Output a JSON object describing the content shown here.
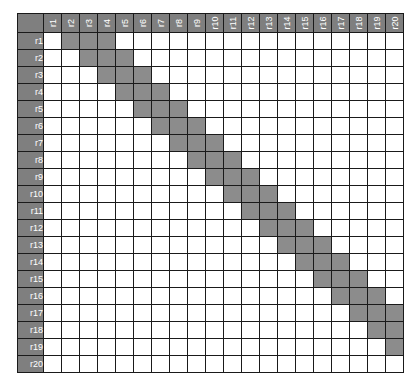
{
  "title_cutoff": "",
  "matrix": {
    "columns": [
      "r1",
      "r2",
      "r3",
      "r4",
      "r5",
      "r6",
      "r7",
      "r8",
      "r9",
      "r10",
      "r11",
      "r12",
      "r13",
      "r14",
      "r15",
      "r16",
      "r17",
      "r18",
      "r19",
      "r20"
    ],
    "rows": [
      "r1",
      "r2",
      "r3",
      "r4",
      "r5",
      "r6",
      "r7",
      "r8",
      "r9",
      "r10",
      "r11",
      "r12",
      "r13",
      "r14",
      "r15",
      "r16",
      "r17",
      "r18",
      "r19",
      "r20"
    ],
    "shaded": {
      "r1": [
        "r2",
        "r3",
        "r4"
      ],
      "r2": [
        "r3",
        "r4",
        "r5"
      ],
      "r3": [
        "r4",
        "r5",
        "r6"
      ],
      "r4": [
        "r5",
        "r6",
        "r7"
      ],
      "r5": [
        "r6",
        "r7",
        "r8"
      ],
      "r6": [
        "r7",
        "r8",
        "r9"
      ],
      "r7": [
        "r8",
        "r9",
        "r10"
      ],
      "r8": [
        "r9",
        "r10",
        "r11"
      ],
      "r9": [
        "r10",
        "r11",
        "r12"
      ],
      "r10": [
        "r11",
        "r12",
        "r13"
      ],
      "r11": [
        "r12",
        "r13",
        "r14"
      ],
      "r12": [
        "r13",
        "r14",
        "r15"
      ],
      "r13": [
        "r14",
        "r15",
        "r16"
      ],
      "r14": [
        "r15",
        "r16",
        "r17"
      ],
      "r15": [
        "r16",
        "r17",
        "r18"
      ],
      "r16": [
        "r17",
        "r18",
        "r19"
      ],
      "r17": [
        "r18",
        "r19",
        "r20"
      ],
      "r18": [
        "r19",
        "r20"
      ],
      "r19": [
        "r20"
      ],
      "r20": []
    },
    "colors": {
      "header_bg": "#7f7f7f",
      "header_text": "#ffffff",
      "shaded_cell": "#8c8c8c",
      "empty_cell": "#ffffff",
      "grid_line": "#1a1a1a"
    }
  }
}
